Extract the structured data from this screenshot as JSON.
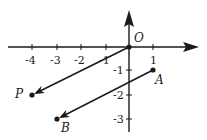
{
  "diagram": {
    "type": "coordinate-plane-vectors",
    "origin_label": "O",
    "x_ticks": [
      {
        "value": -4,
        "label": "-4"
      },
      {
        "value": -3,
        "label": "-3"
      },
      {
        "value": -2,
        "label": "-2"
      },
      {
        "value": -1,
        "label": "-1"
      },
      {
        "value": 1,
        "label": "1"
      }
    ],
    "y_ticks": [
      {
        "value": -1,
        "label": "-1"
      },
      {
        "value": -2,
        "label": "-2"
      },
      {
        "value": -3,
        "label": "-3"
      }
    ],
    "points": [
      {
        "name": "O",
        "x": 0,
        "y": 0
      },
      {
        "name": "P",
        "x": -4,
        "y": -2
      },
      {
        "name": "A",
        "x": 1,
        "y": -1
      },
      {
        "name": "B",
        "x": -3,
        "y": -3
      }
    ],
    "vectors": [
      {
        "from": "O",
        "to": "P"
      },
      {
        "from": "A",
        "to": "B"
      }
    ],
    "labels": {
      "O": "O",
      "P": "P",
      "A": "A",
      "B": "B"
    },
    "colors": {
      "ink": "#1a1a1a",
      "background": "#ffffff"
    }
  }
}
